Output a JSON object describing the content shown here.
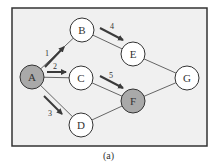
{
  "diagram": {
    "caption": "(a)",
    "frame": {
      "x": 12,
      "y": 8,
      "width": 195,
      "height": 138,
      "fill": "#f0f0f0",
      "stroke": "#333333"
    },
    "colors": {
      "edge": "#555555",
      "arrow": "#3a3a3a",
      "node_fill": "#ffffff",
      "node_highlight": "#a9a9a9",
      "node_stroke": "#333333",
      "text": "#333333"
    },
    "node_radius": 12,
    "nodes": [
      {
        "id": "A",
        "label": "A",
        "x": 32,
        "y": 77,
        "highlighted": true
      },
      {
        "id": "B",
        "label": "B",
        "x": 82,
        "y": 30,
        "highlighted": false
      },
      {
        "id": "C",
        "label": "C",
        "x": 81,
        "y": 78,
        "highlighted": false
      },
      {
        "id": "D",
        "label": "D",
        "x": 81,
        "y": 125,
        "highlighted": false
      },
      {
        "id": "E",
        "label": "E",
        "x": 133,
        "y": 54,
        "highlighted": false
      },
      {
        "id": "F",
        "label": "F",
        "x": 133,
        "y": 101,
        "highlighted": true
      },
      {
        "id": "G",
        "label": "G",
        "x": 187,
        "y": 78,
        "highlighted": false
      }
    ],
    "edges": [
      {
        "from": "A",
        "to": "B"
      },
      {
        "from": "A",
        "to": "C"
      },
      {
        "from": "A",
        "to": "D"
      },
      {
        "from": "B",
        "to": "E"
      },
      {
        "from": "C",
        "to": "F"
      },
      {
        "from": "D",
        "to": "F"
      },
      {
        "from": "E",
        "to": "G"
      },
      {
        "from": "F",
        "to": "G"
      }
    ],
    "arrows": [
      {
        "label": "1",
        "x1": 45,
        "y1": 67,
        "x2": 64,
        "y2": 47,
        "lx": 47,
        "ly": 56
      },
      {
        "label": "2",
        "x1": 47,
        "y1": 72,
        "x2": 66,
        "y2": 72,
        "lx": 55,
        "ly": 69
      },
      {
        "label": "3",
        "x1": 44,
        "y1": 96,
        "x2": 62,
        "y2": 114,
        "lx": 50,
        "ly": 116
      },
      {
        "label": "4",
        "x1": 100,
        "y1": 28,
        "x2": 123,
        "y2": 40,
        "lx": 112,
        "ly": 29
      },
      {
        "label": "5",
        "x1": 100,
        "y1": 76,
        "x2": 123,
        "y2": 88,
        "lx": 111,
        "ly": 78
      }
    ]
  }
}
